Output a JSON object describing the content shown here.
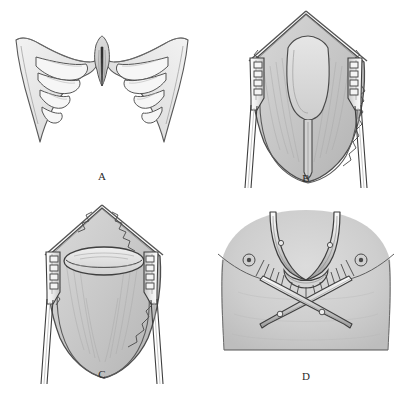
{
  "figure": {
    "background_color": "#ffffff",
    "ink_color": "#3a3a3a",
    "tissue_fill": "#c8c8c8",
    "bone_fill": "#e9e9e9",
    "skin_fill": "#cfcfcf",
    "panel_count": 4
  },
  "panels": [
    {
      "id": "A",
      "label": "A",
      "caption_text": "A",
      "subject": "anterior chest wall skeleton showing deformed costal cartilages and depressed sternum with xiphoid cleft",
      "parts": [
        {
          "name": "left-costal-margin",
          "type": "cartilage-arch"
        },
        {
          "name": "right-costal-margin",
          "type": "cartilage-arch"
        },
        {
          "name": "sternum-body",
          "type": "bone"
        },
        {
          "name": "xiphoid-process",
          "type": "bone-cleft"
        },
        {
          "name": "left-rib-cartilages",
          "type": "rib-group",
          "count": 4
        },
        {
          "name": "right-rib-cartilages",
          "type": "rib-group",
          "count": 4
        }
      ]
    },
    {
      "id": "B",
      "label": "B",
      "caption_text": "B",
      "subject": "operative field held open by two toothed self-retaining retractors exposing a U-shaped muscle flap incision over the sternum",
      "parts": [
        {
          "name": "left-retractor",
          "type": "instrument",
          "teeth": 4
        },
        {
          "name": "right-retractor",
          "type": "instrument",
          "teeth": 4
        },
        {
          "name": "skin-edge",
          "type": "wound-margin"
        },
        {
          "name": "muscle-flap-outline",
          "type": "incision-marking"
        },
        {
          "name": "midline-incision",
          "type": "incision-marking"
        }
      ]
    },
    {
      "id": "C",
      "label": "C",
      "caption_text": "C",
      "subject": "same exposure after flap elevation showing an oval opening in the upper tissue plane",
      "parts": [
        {
          "name": "left-retractor",
          "type": "instrument",
          "teeth": 4
        },
        {
          "name": "right-retractor",
          "type": "instrument",
          "teeth": 4
        },
        {
          "name": "oval-opening",
          "type": "tissue-window"
        },
        {
          "name": "skin-edge",
          "type": "wound-margin"
        }
      ]
    },
    {
      "id": "D",
      "label": "D",
      "caption_text": "D",
      "subject": "external view of the chest with two crossed support bars passed beneath the sternum, nipples marked",
      "parts": [
        {
          "name": "torso",
          "type": "body-surface"
        },
        {
          "name": "left-nipple-marker",
          "type": "landmark"
        },
        {
          "name": "right-nipple-marker",
          "type": "landmark"
        },
        {
          "name": "upper-bar-left",
          "type": "instrument"
        },
        {
          "name": "upper-bar-right",
          "type": "instrument"
        },
        {
          "name": "crossed-bar-one",
          "type": "instrument"
        },
        {
          "name": "crossed-bar-two",
          "type": "instrument"
        },
        {
          "name": "suture-fringe",
          "type": "sutures"
        }
      ]
    }
  ]
}
